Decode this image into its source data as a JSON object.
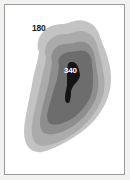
{
  "figure": {
    "background_color": "#f2f2f0",
    "plot_background_color": "#ffffff",
    "border_color": "#9a9a9a"
  },
  "chart_data": {
    "type": "contour",
    "title": "",
    "subtitle": "",
    "xlabel": "",
    "ylabel": "",
    "grid": false,
    "legend": "none",
    "colormap": "grayscale",
    "axis_ticks": [],
    "annotations": [
      {
        "text": "180",
        "level": 180,
        "x_px": 27,
        "y_px": 19,
        "color": "#1a1a1a"
      },
      {
        "text": "340",
        "level": 340,
        "x_px": 59,
        "y_px": 62,
        "color": "#ffffff"
      }
    ],
    "levels": [
      {
        "level": 180,
        "label": "180",
        "fill": "#c3c3c3",
        "order": 1
      },
      {
        "level": 220,
        "label": "",
        "fill": "#ababab",
        "order": 2
      },
      {
        "level": 260,
        "label": "",
        "fill": "#8e8e8e",
        "order": 3
      },
      {
        "level": 300,
        "label": "",
        "fill": "#6d6d6d",
        "order": 4
      },
      {
        "level": 340,
        "label": "340",
        "fill": "#141414",
        "order": 5
      }
    ],
    "band_paths": [
      "M 34 47 C 30 38 35 27 44 22 C 52 18 58 20 63 18 C 68 16 74 14 80 16 C 88 18 93 24 95 32 C 98 40 101 46 103 54 C 106 64 107 74 105 84 C 103 95 98 104 92 112 C 85 121 76 128 66 134 C 56 140 46 145 37 147 C 30 148 24 145 21 138 C 18 130 19 120 21 110 C 23 98 26 86 28 74 C 30 64 33 55 34 47 Z",
      "M 41 52 C 38 44 42 35 50 31 C 57 28 62 30 67 28 C 72 26 78 25 83 28 C 89 31 92 37 93 44 C 95 52 97 58 98 65 C 100 74 100 83 98 91 C 95 100 90 108 84 115 C 77 123 69 129 60 134 C 52 138 44 141 38 141 C 32 141 28 137 27 130 C 26 122 28 113 30 104 C 32 93 35 82 37 72 C 39 63 41 57 41 52 Z",
      "M 47 57 C 45 50 48 43 55 40 C 61 38 65 39 69 38 C 74 36 79 36 83 39 C 87 42 89 47 90 53 C 91 60 92 66 93 72 C 94 79 93 86 91 93 C 88 100 84 106 79 112 C 73 118 66 123 59 126 C 52 129 46 130 42 129 C 37 128 35 124 35 118 C 35 111 37 104 39 96 C 41 87 44 78 45 70 C 46 63 47 60 47 57 Z",
      "M 54 60 C 52 55 55 50 60 48 C 65 46 68 47 72 46 C 76 45 80 45 83 48 C 86 51 87 55 87 60 C 88 66 88 71 88 76 C 88 82 87 88 85 93 C 82 99 78 104 74 108 C 69 113 63 116 58 118 C 53 120 49 120 46 119 C 43 118 42 114 42 110 C 43 104 45 98 47 91 C 49 83 52 76 53 69 C 54 64 54 62 54 60 Z",
      "M 63 62 C 62 59 64 57 67 57 C 70 57 72 59 73 62 C 74 65 75 68 75 71 C 74 74 72 77 70 79 C 68 81 67 83 66 86 C 66 89 66 92 65 95 C 65 97 64 98 63 98 C 61 98 60 96 60 93 C 60 89 61 85 62 81 C 62 77 62 73 62 69 C 62 66 62 63 63 62 Z"
    ]
  }
}
